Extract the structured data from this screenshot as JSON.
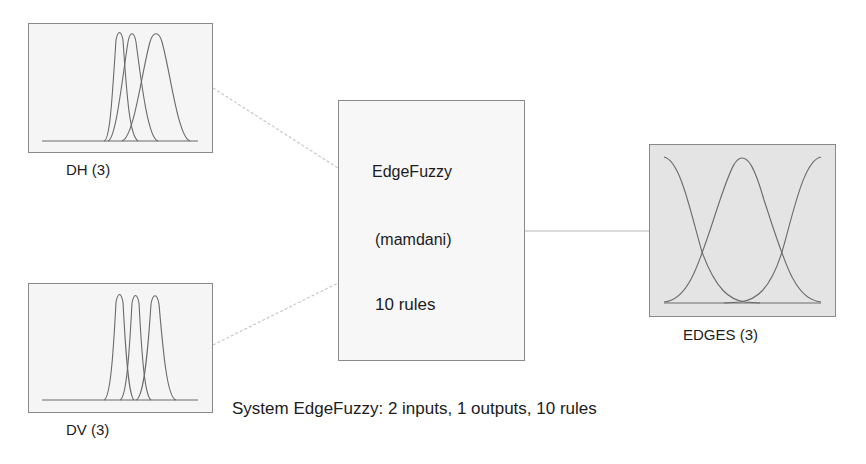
{
  "inputs": [
    {
      "name": "DH",
      "count": 3,
      "label": "DH (3)"
    },
    {
      "name": "DV",
      "count": 3,
      "label": "DV (3)"
    }
  ],
  "output": {
    "name": "EDGES",
    "count": 3,
    "label": "EDGES (3)"
  },
  "system": {
    "name": "EdgeFuzzy",
    "type": "(mamdani)",
    "rules": "10 rules"
  },
  "footer": "System EdgeFuzzy: 2 inputs, 1 outputs, 10 rules",
  "colors": {
    "curve": "#6a6a6a",
    "box_border": "#8a8a8a",
    "input_bg": "#f5f5f5",
    "output_bg": "#e4e4e4",
    "connector": "#c8c8c8"
  }
}
